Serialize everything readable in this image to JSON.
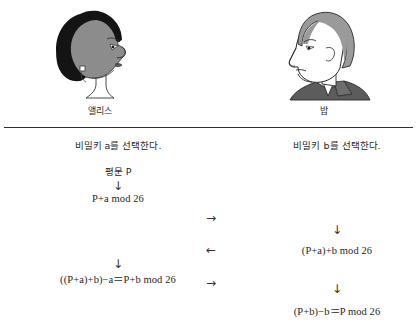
{
  "people": {
    "alice": {
      "name": "앨리스",
      "portrait_icon": "woman-profile-icon"
    },
    "bob": {
      "name": "밥",
      "portrait_icon": "man-profile-icon"
    }
  },
  "divider": {
    "style": "horizontal-rule"
  },
  "alice_column": {
    "choose_key": "비밀키 a를 선택한다.",
    "plaintext": "평문 P",
    "arrow_down_1": "↓",
    "encrypt": "P+a mod 26",
    "arrow_down_2": "↓",
    "decrypt": "((P+a)+b)−a＝P+b mod 26"
  },
  "bob_column": {
    "choose_key": "비밀키 b를 선택한다.",
    "arrow_down_1": "↓",
    "encrypt": "(P+a)+b mod 26",
    "arrow_down_2": "↓",
    "decrypt": "(P+b)−b＝P mod 26"
  },
  "transmission": {
    "arrow_1": "→",
    "arrow_2": "←",
    "arrow_3": "→"
  },
  "colors": {
    "background": "#ffffff",
    "text": "#1f1f1f",
    "rule": "#303030",
    "alice_hair": "#141414",
    "alice_skin": "#8c8c8c",
    "bob_hair": "#9a9a9a",
    "bob_skin": "#ffffff",
    "bob_collar": "#5c5c5c"
  }
}
